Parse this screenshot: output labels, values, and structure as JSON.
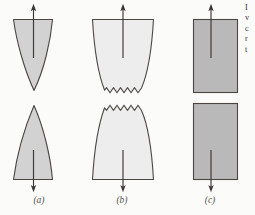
{
  "figure": {
    "type": "diagram",
    "background_color": "#fbfbfa",
    "outline_color": "#4a4742",
    "arrow_color": "#3a3833",
    "caption_color": "#55524e",
    "panels": [
      {
        "id": "a",
        "label": "(a)",
        "label_x": 39,
        "label_y": 203,
        "fracture_mode": "highly ductile",
        "description": "necks down to a point",
        "fill_color": "#d2d2d2",
        "stroke_color": "#4a4742",
        "top_piece": {
          "shape": "downward-tapering-cone-concave-sides",
          "top_y": 18,
          "tip_y": 90,
          "left_x": 13,
          "right_x": 53,
          "tip_x": 33
        },
        "bottom_piece": {
          "shape": "upward-tapering-cone-concave-sides",
          "bottom_y": 180,
          "tip_y": 105,
          "left_x": 13,
          "right_x": 53,
          "tip_x": 33
        },
        "top_arrow": {
          "x": 33,
          "from_y": 60,
          "to_y": 5,
          "direction": "up"
        },
        "bottom_arrow": {
          "x": 33,
          "from_y": 150,
          "to_y": 190,
          "direction": "down"
        }
      },
      {
        "id": "b",
        "label": "(b)",
        "label_x": 122,
        "label_y": 203,
        "fracture_mode": "moderately ductile",
        "description": "cup-and-cone with jagged fracture surface",
        "fill_color": "#ededed",
        "stroke_color": "#4a4742",
        "zigzag_teeth": 11,
        "top_piece": {
          "shape": "cup-with-zigzag-bottom",
          "top_y": 18,
          "fracture_y": 91,
          "left_x": 92,
          "right_x": 154
        },
        "bottom_piece": {
          "shape": "cone-with-zigzag-top",
          "bottom_y": 180,
          "fracture_y": 103,
          "left_x": 92,
          "right_x": 154
        },
        "top_arrow": {
          "x": 123,
          "from_y": 60,
          "to_y": 5,
          "direction": "up"
        },
        "bottom_arrow": {
          "x": 123,
          "from_y": 150,
          "to_y": 190,
          "direction": "down"
        }
      },
      {
        "id": "c",
        "label": "(c)",
        "label_x": 210,
        "label_y": 203,
        "fracture_mode": "brittle",
        "description": "flat fracture surface, no deformation",
        "fill_color": "#b9b9b9",
        "stroke_color": "#4a4742",
        "top_piece": {
          "shape": "rectangle",
          "top_y": 18,
          "fracture_y": 93,
          "left_x": 193,
          "right_x": 238
        },
        "bottom_piece": {
          "shape": "rectangle",
          "top_y": 103,
          "bottom_y": 180,
          "left_x": 193,
          "right_x": 238
        },
        "top_arrow": {
          "x": 211,
          "from_y": 60,
          "to_y": 5,
          "direction": "up"
        },
        "bottom_arrow": {
          "x": 211,
          "from_y": 150,
          "to_y": 190,
          "direction": "down"
        }
      }
    ],
    "side_text": {
      "clipped": true,
      "lines": [
        "I",
        "v",
        "c",
        "r",
        "t"
      ]
    }
  }
}
